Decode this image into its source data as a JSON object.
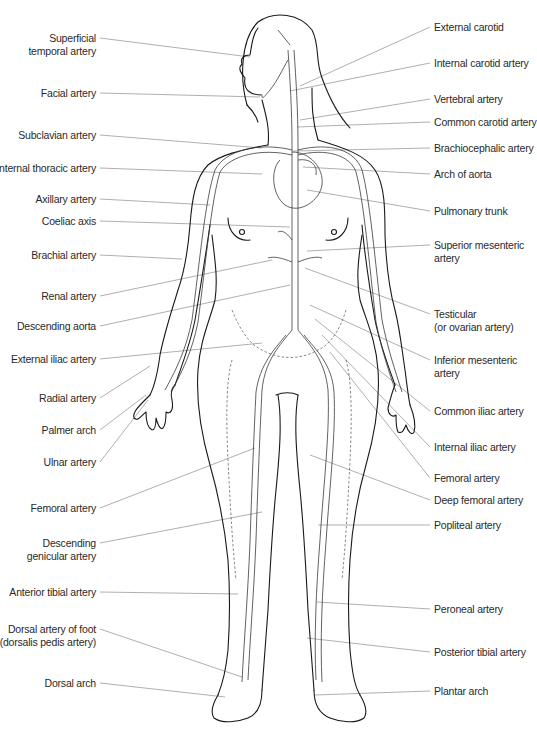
{
  "diagram": {
    "line_color": "#9a9a9a",
    "outline_color": "#1a1a1a",
    "text_color": "#2a2a2a"
  },
  "left_labels": [
    {
      "lines": [
        "Superficial",
        "temporal artery"
      ],
      "x": 100,
      "y": 38,
      "tx": 250,
      "ty": 57
    },
    {
      "lines": [
        "Facial artery"
      ],
      "x": 100,
      "y": 93,
      "tx": 260,
      "ty": 97
    },
    {
      "lines": [
        "Subclavian artery"
      ],
      "x": 100,
      "y": 135,
      "tx": 262,
      "ty": 148
    },
    {
      "lines": [
        "Internal thoracic artery"
      ],
      "x": 100,
      "y": 168,
      "tx": 262,
      "ty": 174
    },
    {
      "lines": [
        "Axillary artery"
      ],
      "x": 100,
      "y": 199,
      "tx": 210,
      "ty": 205
    },
    {
      "lines": [
        "Coeliac axis"
      ],
      "x": 100,
      "y": 221,
      "tx": 290,
      "ty": 227
    },
    {
      "lines": [
        "Brachial artery"
      ],
      "x": 100,
      "y": 255,
      "tx": 182,
      "ty": 259
    },
    {
      "lines": [
        "Renal artery"
      ],
      "x": 100,
      "y": 296,
      "tx": 272,
      "ty": 260
    },
    {
      "lines": [
        "Descending aorta"
      ],
      "x": 100,
      "y": 326,
      "tx": 290,
      "ty": 285
    },
    {
      "lines": [
        "External iliac artery"
      ],
      "x": 100,
      "y": 359,
      "tx": 262,
      "ty": 343
    },
    {
      "lines": [
        "Radial artery"
      ],
      "x": 100,
      "y": 398,
      "tx": 150,
      "ty": 366
    },
    {
      "lines": [
        "Palmer arch"
      ],
      "x": 100,
      "y": 430,
      "tx": 146,
      "ty": 395
    },
    {
      "lines": [
        "Ulnar artery"
      ],
      "x": 100,
      "y": 462,
      "tx": 148,
      "ty": 400
    },
    {
      "lines": [
        "Femoral artery"
      ],
      "x": 100,
      "y": 508,
      "tx": 255,
      "ty": 448
    },
    {
      "lines": [
        "Descending",
        "genicular artery"
      ],
      "x": 100,
      "y": 543,
      "tx": 262,
      "ty": 512
    },
    {
      "lines": [
        "Anterior tibial artery"
      ],
      "x": 100,
      "y": 592,
      "tx": 238,
      "ty": 594
    },
    {
      "lines": [
        "Dorsal artery of foot",
        "(dorsalis pedis artery)"
      ],
      "x": 100,
      "y": 629,
      "tx": 242,
      "ty": 677
    },
    {
      "lines": [
        "Dorsal arch"
      ],
      "x": 100,
      "y": 683,
      "tx": 225,
      "ty": 697
    }
  ],
  "right_labels": [
    {
      "lines": [
        "External carotid"
      ],
      "x": 430,
      "y": 27,
      "tx": 300,
      "ty": 86
    },
    {
      "lines": [
        "Internal carotid artery"
      ],
      "x": 430,
      "y": 63,
      "tx": 290,
      "ty": 91
    },
    {
      "lines": [
        "Vertebral artery"
      ],
      "x": 430,
      "y": 99,
      "tx": 300,
      "ty": 120
    },
    {
      "lines": [
        "Common carotid artery"
      ],
      "x": 430,
      "y": 122,
      "tx": 297,
      "ty": 127
    },
    {
      "lines": [
        "Brachiocephalic artery"
      ],
      "x": 430,
      "y": 148,
      "tx": 293,
      "ty": 151
    },
    {
      "lines": [
        "Arch of aorta"
      ],
      "x": 430,
      "y": 174,
      "tx": 303,
      "ty": 167
    },
    {
      "lines": [
        "Pulmonary trunk"
      ],
      "x": 430,
      "y": 211,
      "tx": 307,
      "ty": 190
    },
    {
      "lines": [
        "Superior mesenteric",
        "artery"
      ],
      "x": 430,
      "y": 245,
      "tx": 307,
      "ty": 251
    },
    {
      "lines": [
        "Testicular",
        "(or ovarian artery)"
      ],
      "x": 430,
      "y": 314,
      "tx": 305,
      "ty": 268
    },
    {
      "lines": [
        "Inferior mesenteric",
        "artery"
      ],
      "x": 430,
      "y": 360,
      "tx": 310,
      "ty": 305
    },
    {
      "lines": [
        "Common iliac artery"
      ],
      "x": 430,
      "y": 411,
      "tx": 315,
      "ty": 319
    },
    {
      "lines": [
        "Internal iliac artery"
      ],
      "x": 430,
      "y": 447,
      "tx": 322,
      "ty": 335
    },
    {
      "lines": [
        "Femoral artery"
      ],
      "x": 430,
      "y": 478,
      "tx": 330,
      "ty": 352
    },
    {
      "lines": [
        "Deep femoral artery"
      ],
      "x": 430,
      "y": 500,
      "tx": 310,
      "ty": 455
    },
    {
      "lines": [
        "Popliteal artery"
      ],
      "x": 430,
      "y": 525,
      "tx": 318,
      "ty": 525
    },
    {
      "lines": [
        "Peroneal artery"
      ],
      "x": 430,
      "y": 609,
      "tx": 317,
      "ty": 602
    },
    {
      "lines": [
        "Posterior tibial artery"
      ],
      "x": 430,
      "y": 652,
      "tx": 307,
      "ty": 638
    },
    {
      "lines": [
        "Plantar arch"
      ],
      "x": 430,
      "y": 691,
      "tx": 315,
      "ty": 695
    }
  ]
}
